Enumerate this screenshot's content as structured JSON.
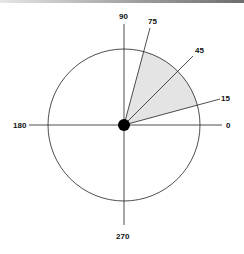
{
  "diagram": {
    "title": "",
    "center": {
      "x": 124,
      "y": 125
    },
    "circle_radius": 76,
    "center_dot_radius": 6,
    "shaded_sector": {
      "from_deg": 15,
      "to_deg": 75,
      "fill": "#e4e4e4"
    },
    "axis_labels": {
      "deg0": "0",
      "deg90": "90",
      "deg180": "180",
      "deg270": "270"
    },
    "ray_labels": {
      "deg15": "15",
      "deg45": "45",
      "deg75": "75"
    },
    "rays_deg": [
      15,
      45,
      75
    ],
    "colors": {
      "line": "#222222",
      "shade": "#e4e4e4",
      "dot": "#000000"
    }
  }
}
